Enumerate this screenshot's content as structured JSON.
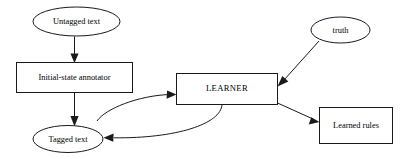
{
  "diagram": {
    "background_color": "#ffffff",
    "stroke_color": "#1a1a1a",
    "text_color": "#000000",
    "nodes": [
      {
        "id": "untagged_text",
        "label": "Untagged text",
        "shape": "ellipse",
        "cx": 76.5,
        "cy": 21.5,
        "rx": 43.5,
        "ry": 14.5
      },
      {
        "id": "initial_state_annotator",
        "label": "Initial-state annotator",
        "shape": "rectangle",
        "x": 16.5,
        "y": 62.5,
        "width": 116,
        "height": 30
      },
      {
        "id": "tagged_text",
        "label": "Tagged text",
        "shape": "ellipse",
        "cx": 68,
        "cy": 139,
        "rx": 35,
        "ry": 13.5
      },
      {
        "id": "learner",
        "label": "LEARNER",
        "shape": "rectangle",
        "x": 176.5,
        "y": 73.5,
        "width": 101,
        "height": 31
      },
      {
        "id": "truth",
        "label": "truth",
        "shape": "ellipse",
        "cx": 340.5,
        "cy": 30,
        "rx": 29.5,
        "ry": 13
      },
      {
        "id": "learned_rules",
        "label": "Learned rules",
        "shape": "rectangle",
        "x": 319.5,
        "y": 107.5,
        "width": 73,
        "height": 36
      }
    ],
    "edges": [
      {
        "id": "untagged-to-annotator",
        "from": "untagged_text",
        "to": "initial_state_annotator",
        "style": "straight",
        "arrow": "end"
      },
      {
        "id": "annotator-to-tagged",
        "from": "initial_state_annotator",
        "to": "tagged_text",
        "style": "straight",
        "arrow": "end"
      },
      {
        "id": "tagged-to-learner",
        "from": "tagged_text",
        "to": "learner",
        "style": "curved",
        "arrow": "end"
      },
      {
        "id": "learner-to-tagged",
        "from": "learner",
        "to": "tagged_text",
        "style": "curved",
        "arrow": "end"
      },
      {
        "id": "truth-to-learner",
        "from": "truth",
        "to": "learner",
        "style": "straight",
        "arrow": "end"
      },
      {
        "id": "learner-to-learned-rules",
        "from": "learner",
        "to": "learned_rules",
        "style": "straight",
        "arrow": "end"
      }
    ]
  }
}
